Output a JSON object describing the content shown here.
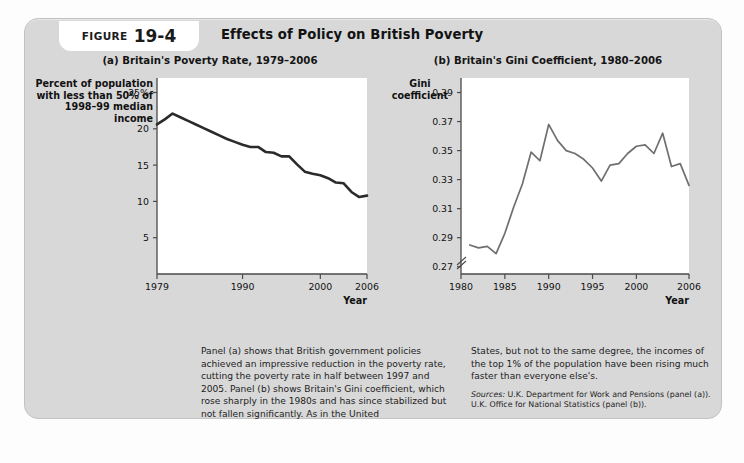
{
  "figure": {
    "label_word": "FIGURE",
    "number": "19-4",
    "title": "Effects of Policy on British Poverty"
  },
  "panel_a": {
    "title": "(a) Britain's Poverty Rate, 1979–2006",
    "y_axis_title": "Percent of population with less than 50% of 1998–99 median income",
    "x_axis_title": "Year"
  },
  "panel_b": {
    "title": "(b) Britain's Gini Coefficient, 1980–2006",
    "y_axis_title": "Gini coefficient",
    "x_axis_title": "Year"
  },
  "caption": {
    "left": "Panel (a) shows that British government policies achieved an impressive reduction in the poverty rate, cutting the poverty rate in half between 1997 and 2005. Panel (b) shows Britain's Gini coefficient, which rose sharply in the 1980s and has since stabilized but not fallen significantly. As in the United",
    "right": "States, but not to the same degree, the incomes of the top 1% of the population have been rising much faster than everyone else's.",
    "sources_label": "Sources:",
    "sources_line1": " U.K. Department for Work and Pensions (panel (a)).",
    "sources_line2": "U.K. Office for National Statistics (panel (b))."
  },
  "chart_data": [
    {
      "type": "line",
      "title": "(a) Britain's Poverty Rate, 1979–2006",
      "xlabel": "Year",
      "ylabel": "Percent of population with less than 50% of 1998–99 median income",
      "xlim": [
        1979,
        2006
      ],
      "ylim": [
        0,
        27
      ],
      "ytick_labels": [
        "25%",
        "20",
        "15",
        "10",
        "5"
      ],
      "ytick_values": [
        25,
        20,
        15,
        10,
        5
      ],
      "xtick_values": [
        1979,
        1990,
        2000,
        2006
      ],
      "xtick_labels": [
        "1979",
        "1990",
        "2000",
        "2006"
      ],
      "grid": false,
      "legend": "none",
      "line_color": "#2b2b2b",
      "x": [
        1979,
        1980,
        1981,
        1982,
        1983,
        1984,
        1985,
        1986,
        1987,
        1988,
        1989,
        1990,
        1991,
        1992,
        1993,
        1994,
        1995,
        1996,
        1997,
        1998,
        1999,
        2000,
        2001,
        2002,
        2003,
        2004,
        2005,
        2006
      ],
      "values": [
        20.6,
        21.3,
        22.1,
        21.6,
        21.1,
        20.6,
        20.1,
        19.6,
        19.1,
        18.6,
        18.2,
        17.8,
        17.5,
        17.5,
        16.8,
        16.7,
        16.2,
        16.2,
        15.1,
        14.1,
        13.8,
        13.6,
        13.2,
        12.6,
        12.5,
        11.3,
        10.6,
        10.8
      ]
    },
    {
      "type": "line",
      "title": "(b) Britain's Gini Coefficient, 1980–2006",
      "xlabel": "Year",
      "ylabel": "Gini coefficient",
      "xlim": [
        1980,
        2006
      ],
      "ylim": [
        0.265,
        0.4
      ],
      "axis_break": true,
      "axis_break_below": 0.27,
      "ytick_labels": [
        "0.39",
        "0.37",
        "0.35",
        "0.33",
        "0.31",
        "0.29",
        "0.27"
      ],
      "ytick_values": [
        0.39,
        0.37,
        0.35,
        0.33,
        0.31,
        0.29,
        0.27
      ],
      "xtick_values": [
        1980,
        1985,
        1990,
        1995,
        2000,
        2006
      ],
      "xtick_labels": [
        "1980",
        "1985",
        "1990",
        "1995",
        "2000",
        "2006"
      ],
      "grid": false,
      "legend": "none",
      "line_color": "#6f6f6f",
      "x": [
        1981,
        1982,
        1983,
        1984,
        1985,
        1986,
        1987,
        1988,
        1989,
        1990,
        1991,
        1992,
        1993,
        1994,
        1995,
        1996,
        1997,
        1998,
        1999,
        2000,
        2001,
        2002,
        2003,
        2004,
        2005,
        2006
      ],
      "values": [
        0.285,
        0.283,
        0.284,
        0.279,
        0.293,
        0.311,
        0.327,
        0.349,
        0.343,
        0.368,
        0.357,
        0.35,
        0.348,
        0.344,
        0.338,
        0.329,
        0.34,
        0.341,
        0.348,
        0.353,
        0.354,
        0.348,
        0.362,
        0.339,
        0.341,
        0.326,
        0.334
      ]
    }
  ]
}
